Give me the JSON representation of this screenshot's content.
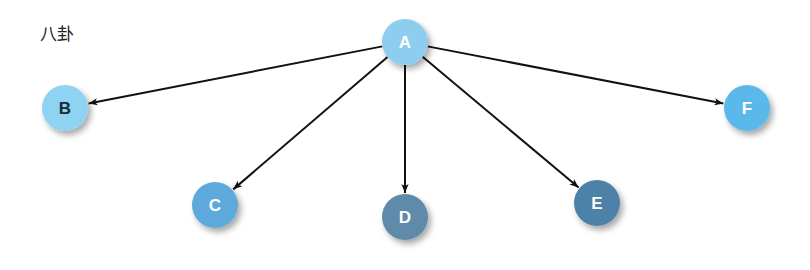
{
  "title": "八卦",
  "nodes": [
    {
      "id": "A",
      "label": "A",
      "x": 405,
      "y": 42,
      "r": 23,
      "fill": "#8ecdf0",
      "text_color": "#ffffff"
    },
    {
      "id": "B",
      "label": "B",
      "x": 65,
      "y": 108,
      "r": 23,
      "fill": "#8fd3f2",
      "text_color": "#1a2a3a"
    },
    {
      "id": "C",
      "label": "C",
      "x": 215,
      "y": 205,
      "r": 23,
      "fill": "#5da9dc",
      "text_color": "#ffffff"
    },
    {
      "id": "D",
      "label": "D",
      "x": 405,
      "y": 217,
      "r": 23,
      "fill": "#5f8aaa",
      "text_color": "#ffffff"
    },
    {
      "id": "E",
      "label": "E",
      "x": 597,
      "y": 203,
      "r": 23,
      "fill": "#4e82a8",
      "text_color": "#ffffff"
    },
    {
      "id": "F",
      "label": "F",
      "x": 747,
      "y": 108,
      "r": 23,
      "fill": "#5ab9ea",
      "text_color": "#ffffff"
    }
  ],
  "edges": [
    {
      "from": "A",
      "to": "B"
    },
    {
      "from": "A",
      "to": "C"
    },
    {
      "from": "A",
      "to": "D"
    },
    {
      "from": "A",
      "to": "E"
    },
    {
      "from": "A",
      "to": "F"
    }
  ]
}
